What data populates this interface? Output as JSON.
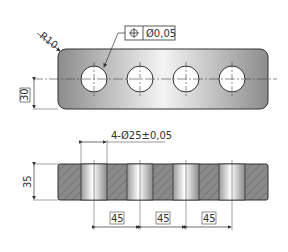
{
  "drawing": {
    "top_view": {
      "radius_label": "R10",
      "tolerance_symbol": "position-icon",
      "tolerance_value": "Ø0,05",
      "height_dim": "30",
      "hole_count": 4
    },
    "section_view": {
      "hole_callout": "4-Ø25±0,05",
      "thickness_dim": "35",
      "pitch_dims": [
        "45",
        "45",
        "45"
      ]
    },
    "colors": {
      "plate_light": "#f2f2f2",
      "plate_dark": "#8a8a8a",
      "hatch": "#6e6e6e",
      "line": "#333333"
    }
  }
}
